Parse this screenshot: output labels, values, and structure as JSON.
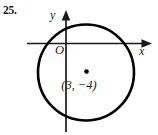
{
  "figure": {
    "problem_number": "25.",
    "type": "coordinate-plane-circle-diagram",
    "background_color": "#ffffff",
    "stroke_color": "#000000",
    "axis_color": "#1a1a1a",
    "width": 158,
    "height": 135,
    "axes": {
      "y_axis_label": "y",
      "x_axis_label": "x",
      "origin_label": "O",
      "origin_px": {
        "x": 66,
        "y": 43.5
      },
      "x_axis_start_px": 27,
      "x_axis_end_px": 152,
      "y_axis_top_px": 10,
      "y_axis_bottom_px": 132,
      "arrowheads": [
        "y-up",
        "x-right"
      ]
    },
    "circle": {
      "center_label": "(3, −4)",
      "center_x": 3,
      "center_y": -4,
      "center_px": {
        "x": 86,
        "y": 72.5
      },
      "radius_px": 48,
      "stroke_width_px": 2.6,
      "fill": "none"
    },
    "center_point": {
      "marker": "filled-dot",
      "px": {
        "x": 86.5,
        "y": 71.5
      },
      "radius_px": 2.2
    }
  }
}
